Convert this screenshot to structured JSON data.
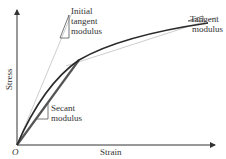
{
  "diagram": {
    "type": "stress-strain-moduli",
    "axes": {
      "x_label": "Strain",
      "y_label": "Stress",
      "origin_label": "O"
    },
    "annotations": {
      "initial_tangent": {
        "line1": "Initial",
        "line2": "tangent",
        "line3": "modulus"
      },
      "tangent": {
        "line1": "Tangent",
        "line2": "modulus"
      },
      "secant": {
        "line1": "Secant",
        "line2": "modulus"
      }
    },
    "colors": {
      "axis": "#333333",
      "curve": "#2a2a2a",
      "secant_line": "#555555",
      "tangent_line": "#b0b0b0",
      "text": "#333333",
      "background": "#ffffff"
    }
  }
}
